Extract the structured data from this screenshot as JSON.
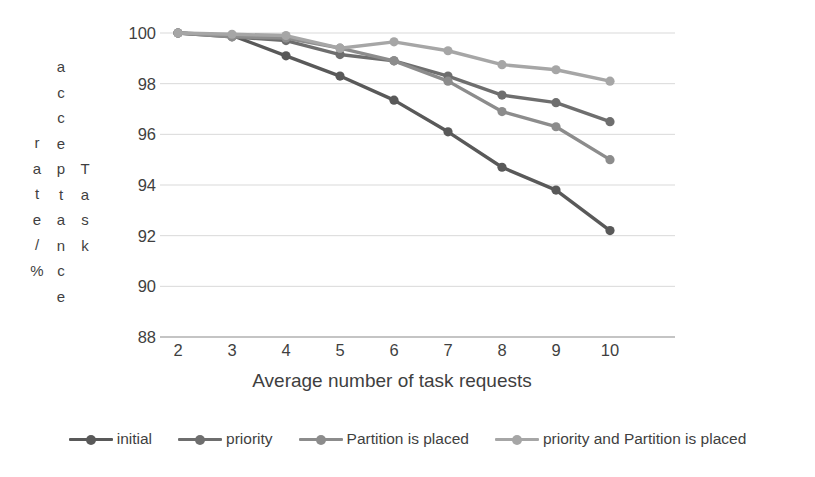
{
  "chart_data": {
    "type": "line",
    "title": "",
    "xlabel": "Average number of task requests",
    "ylabel": "Task acceptance rate/%",
    "ylabel_columns": [
      "rate/%",
      "acceptance",
      "Task"
    ],
    "x": [
      2,
      3,
      4,
      5,
      6,
      7,
      8,
      9,
      10
    ],
    "xticklabels": [
      "2",
      "3",
      "4",
      "5",
      "6",
      "7",
      "8",
      "9",
      "10"
    ],
    "yticklabels": [
      "100",
      "98",
      "96",
      "94",
      "92",
      "90",
      "88"
    ],
    "yticks": [
      100,
      98,
      96,
      94,
      92,
      90,
      88
    ],
    "xlim": [
      2,
      10
    ],
    "ylim": [
      88,
      100
    ],
    "grid": "horizontal",
    "legend_position": "bottom",
    "markers": "circle",
    "series": [
      {
        "name": "initial",
        "color": "#595959",
        "values": [
          100.0,
          99.9,
          99.1,
          98.3,
          97.35,
          96.1,
          94.7,
          93.8,
          92.2
        ]
      },
      {
        "name": "priority",
        "color": "#6e6e6e",
        "values": [
          100.0,
          99.85,
          99.7,
          99.15,
          98.9,
          98.3,
          97.55,
          97.25,
          96.5
        ]
      },
      {
        "name": "Partition is placed",
        "color": "#8c8c8c",
        "values": [
          100.0,
          99.85,
          99.8,
          99.4,
          98.9,
          98.1,
          96.9,
          96.3,
          95.0
        ]
      },
      {
        "name": "priority and Partition is placed",
        "color": "#a6a6a6",
        "values": [
          100.0,
          99.95,
          99.9,
          99.4,
          99.65,
          99.3,
          98.75,
          98.55,
          98.1
        ]
      }
    ]
  },
  "axis": {
    "line_color": "#b0b0b0",
    "grid_color": "#d9d9d9"
  },
  "legend": [
    {
      "label": "initial",
      "color": "#595959"
    },
    {
      "label": "priority",
      "color": "#6e6e6e"
    },
    {
      "label": "Partition is placed",
      "color": "#8c8c8c"
    },
    {
      "label": "priority and Partition is placed",
      "color": "#a6a6a6"
    }
  ]
}
